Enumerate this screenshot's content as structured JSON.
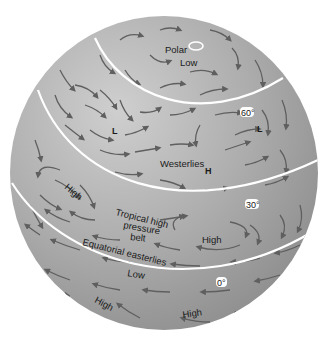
{
  "diagram": {
    "colors": {
      "globe_light": "#c9c9c9",
      "globe_mid": "#a9a9a9",
      "globe_dark": "#8a8a8a",
      "arrow": "#5f5f5f",
      "latitude_line": "#ffffff",
      "text": "#1a1a1a",
      "background": "#ffffff"
    },
    "latitude_lines": [
      {
        "id": "lat-60",
        "label": "60°"
      },
      {
        "id": "lat-30",
        "label": "30°"
      },
      {
        "id": "lat-0",
        "label": "0°"
      }
    ],
    "labels": {
      "polar": "Polar",
      "low_polar": "Low",
      "low_symbol_left": "L",
      "low_symbol_right": "L",
      "westerlies": "Westerlies",
      "high_symbol": "H",
      "high_left": "High",
      "tropical_line1": "Tropical high",
      "tropical_line2": "pressure",
      "tropical_line3": "belt",
      "high_right": "High",
      "equatorial_easterlies": "Equatorial easterlies",
      "low_equator": "Low",
      "high_bottom_left": "High",
      "high_bottom": "High"
    },
    "icons": {
      "polar_low_marker": "white-ellipse",
      "wind_arrows": "curved-arrow"
    }
  }
}
